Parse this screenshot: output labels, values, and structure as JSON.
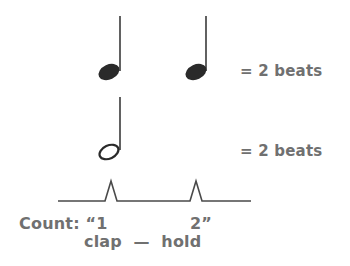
{
  "diagram": {
    "rows": [
      {
        "notes": [
          "quarter-note",
          "quarter-note"
        ],
        "equation": "= 2 beats"
      },
      {
        "notes": [
          "half-note"
        ],
        "equation": "= 2 beats"
      }
    ],
    "pulse": {
      "peaks": 2
    },
    "count": {
      "prefix": "Count: “1",
      "beat2": "2”"
    },
    "actions": "clap  —  hold"
  },
  "colors": {
    "note": "#2a2a2a",
    "text": "#707070",
    "line": "#4a4a4a",
    "background": "#ffffff"
  }
}
